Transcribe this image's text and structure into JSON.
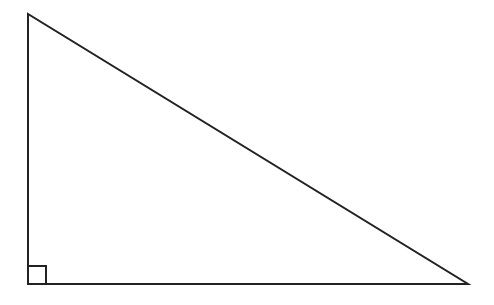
{
  "diagram": {
    "type": "right-triangle",
    "stroke_color": "#222222",
    "background": "#ffffff",
    "vertices": {
      "top": [
        28,
        14
      ],
      "right_angle": [
        28,
        284
      ],
      "right": [
        468,
        284
      ]
    },
    "right_angle_marker": {
      "size": 18
    }
  }
}
